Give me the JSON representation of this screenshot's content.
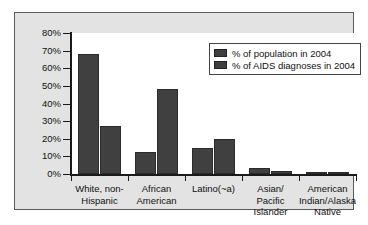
{
  "chart_data": {
    "type": "bar",
    "title": "",
    "xlabel": "",
    "ylabel": "",
    "ylim": [
      0,
      80
    ],
    "ytick_labels": [
      "80%",
      "70%",
      "60%",
      "50%",
      "40%",
      "30%",
      "20%",
      "10%",
      "0%"
    ],
    "ytick_values": [
      80,
      70,
      60,
      50,
      40,
      30,
      20,
      10,
      0
    ],
    "grid": false,
    "legend_position": "top-right",
    "categories": [
      "White, non-Hispanic",
      "African American",
      "Latino(~a)",
      "Asian/Pacific Islander",
      "American Indian/Alaska Native"
    ],
    "category_lines": [
      [
        "White, non-",
        "Hispanic"
      ],
      [
        "African",
        "American"
      ],
      [
        "Latino(~a)"
      ],
      [
        "Asian/",
        "Pacific",
        "Islander"
      ],
      [
        "American",
        "Indian/Alaska",
        "Native"
      ]
    ],
    "series": [
      {
        "name": "% of population in 2004",
        "color": "#404040",
        "values": [
          68,
          12.5,
          14.5,
          3.5,
          1
        ]
      },
      {
        "name": "% of AIDS diagnoses in 2004",
        "color": "#404040",
        "values": [
          27,
          48,
          20,
          1.5,
          1
        ]
      }
    ]
  },
  "legend": {
    "items": [
      {
        "label": "% of population in 2004",
        "color": "#3d3d3d"
      },
      {
        "label": "% of AIDS diagnoses in 2004",
        "color": "#3d3d3d"
      }
    ]
  },
  "colors": {
    "bar": "#404040",
    "axis": "#1a1a1a",
    "panel_background": "#e3e3e3",
    "plot_background": "#ffffff",
    "text": "#111111"
  }
}
